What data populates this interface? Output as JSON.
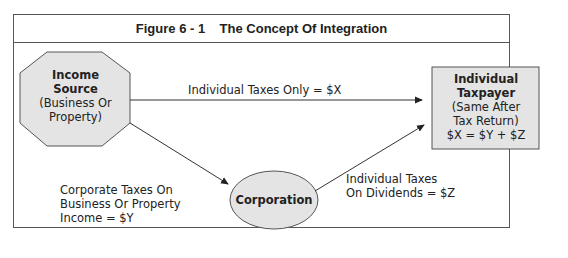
{
  "figure": {
    "title": "Figure 6 - 1    The Concept Of Integration"
  },
  "nodes": {
    "income_source": {
      "title_line1": "Income",
      "title_line2": "Source",
      "sub_line1": "(Business Or",
      "sub_line2": "Property)",
      "shape": "octagon"
    },
    "individual_taxpayer": {
      "title_line1": "Individual",
      "title_line2": "Taxpayer",
      "sub_line1": "(Same After",
      "sub_line2": "Tax Return)",
      "sub_line3": "$X = $Y + $Z",
      "shape": "rectangle"
    },
    "corporation": {
      "title": "Corporation",
      "shape": "ellipse"
    }
  },
  "edges": {
    "direct": {
      "label": "Individual Taxes Only = $X",
      "from": "income_source",
      "to": "individual_taxpayer"
    },
    "corporate": {
      "label_line1": "Corporate Taxes On",
      "label_line2": "Business Or Property",
      "label_line3": "Income = $Y",
      "from": "income_source",
      "to": "corporation"
    },
    "dividends": {
      "label_line1": "Individual Taxes",
      "label_line2": "On Dividends = $Z",
      "from": "corporation",
      "to": "individual_taxpayer"
    }
  },
  "colors": {
    "node_fill": "#e4e4e4",
    "stroke": "#444444",
    "text": "#222222"
  }
}
